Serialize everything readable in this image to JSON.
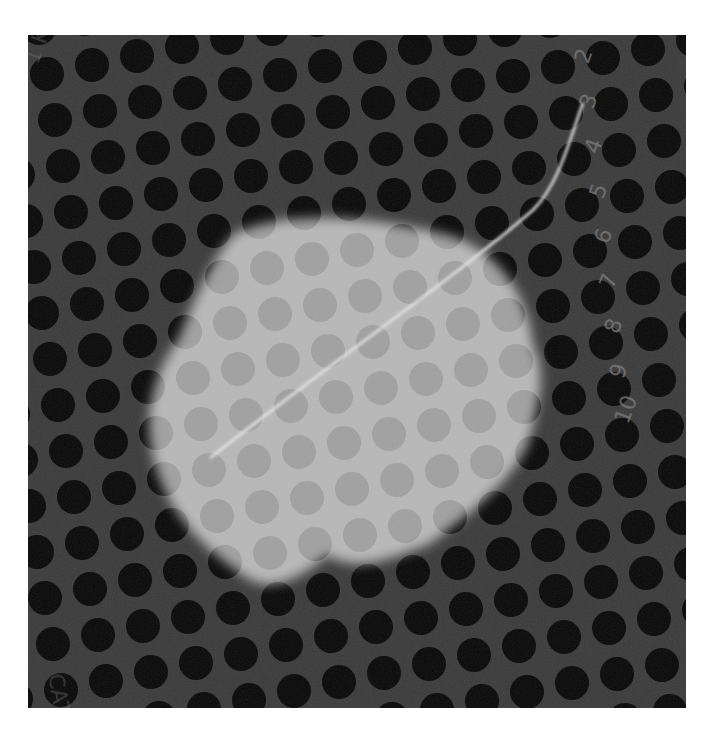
{
  "image": {
    "kind": "radiograph",
    "background_color": "#3a3a3a",
    "dot_color": "#080808",
    "blob_color": "#bdbdbd",
    "wire_color": "#e6e6e6",
    "frame": {
      "x": 28,
      "y": 35,
      "width": 658,
      "height": 673
    }
  },
  "ruler_digits": [
    "2",
    "3",
    "4",
    "5",
    "6",
    "7",
    "8",
    "9",
    "10"
  ],
  "corner_text": {
    "top_left": "1 K 3 L",
    "bottom_left": "CAT NO"
  },
  "grid": {
    "origin_x": 27,
    "origin_y": 85,
    "row_dx": 45,
    "row_dy": -9,
    "col_dx": 8,
    "col_dy": 46,
    "radius": 17,
    "rows": 16,
    "cols": 16
  }
}
